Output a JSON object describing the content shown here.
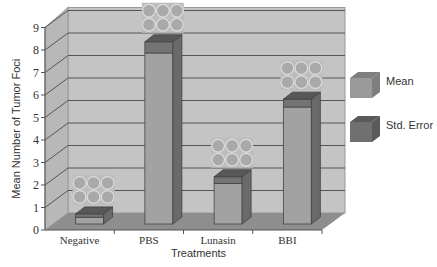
{
  "chart_data": {
    "type": "bar",
    "title": "",
    "xlabel": "Treatments",
    "ylabel": "Mean Number of Tumor Foci",
    "ylim": [
      0,
      9
    ],
    "yticks": [
      0,
      1,
      2,
      3,
      4,
      5,
      6,
      7,
      8,
      9
    ],
    "grid": true,
    "style": "3d",
    "legend_position": "right",
    "categories": [
      "Negative",
      "PBS",
      "Lunasin",
      "BBI"
    ],
    "series": [
      {
        "name": "Mean",
        "values": [
          0.3,
          7.6,
          1.8,
          5.2
        ],
        "color": "#9a9a9a"
      },
      {
        "name": "Std. Error",
        "values": [
          0.15,
          0.5,
          0.3,
          0.35
        ],
        "color": "#707070"
      }
    ],
    "annotations": [
      "Well-plate photo images above each bar (6 wells each)"
    ]
  },
  "legend": {
    "items": [
      {
        "label": "Mean"
      },
      {
        "label": "Std. Error"
      }
    ]
  }
}
